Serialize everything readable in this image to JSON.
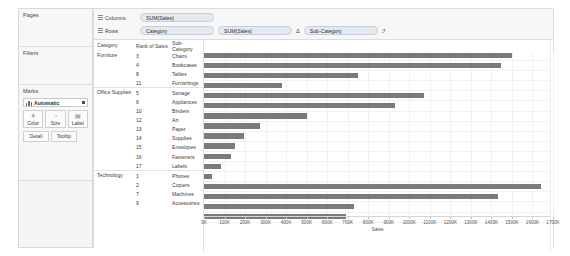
{
  "sidebar": {
    "pages": {
      "title": "Pages"
    },
    "filters": {
      "title": "Filters"
    },
    "marks": {
      "title": "Marks",
      "mark_type": "Automatic",
      "mark_type_icon": "bar-chart-icon",
      "buttons": [
        {
          "label": "Color",
          "icon": "color-palette-icon",
          "glyph": "⚘"
        },
        {
          "label": "Size",
          "icon": "size-icon",
          "glyph": "◔"
        },
        {
          "label": "Label",
          "icon": "label-icon",
          "glyph": "▤"
        }
      ],
      "buttons_small": [
        {
          "label": "Detail",
          "icon": "detail-icon"
        },
        {
          "label": "Tooltip",
          "icon": "tooltip-icon"
        }
      ]
    }
  },
  "shelves": {
    "columns": {
      "label": "Columns",
      "icon": "columns-grid-icon",
      "pills": [
        {
          "text": "SUM(Sales)"
        }
      ]
    },
    "rows": {
      "label": "Rows",
      "icon": "rows-grid-icon",
      "pills": [
        {
          "text": "Category"
        },
        {
          "text": "SUM(Sales)"
        },
        {
          "text": "Sub-Category"
        }
      ],
      "sort_icon": "sort-delta-icon",
      "sort_glyph": "Δ",
      "filter_icon": "filter-funnel-icon",
      "filter_glyph": "ℱ"
    }
  },
  "table": {
    "headers": {
      "category": "Category",
      "rank": "Rank of Sales",
      "subcategory": "Sub-Category"
    },
    "categories": [
      {
        "name": "Furniture",
        "rows": [
          {
            "rank": "3",
            "subcategory": "Chairs",
            "sales": 1501
          },
          {
            "rank": "4",
            "subcategory": "Bookcases",
            "sales": 1445
          },
          {
            "rank": "8",
            "subcategory": "Tables",
            "sales": 750
          },
          {
            "rank": "11",
            "subcategory": "Furnishings",
            "sales": 382
          }
        ]
      },
      {
        "name": "Office Supplies",
        "rows": [
          {
            "rank": "5",
            "subcategory": "Storage",
            "sales": 1073
          },
          {
            "rank": "6",
            "subcategory": "Appliances",
            "sales": 930
          },
          {
            "rank": "10",
            "subcategory": "Binders",
            "sales": 500
          },
          {
            "rank": "12",
            "subcategory": "Art",
            "sales": 275
          },
          {
            "rank": "13",
            "subcategory": "Paper",
            "sales": 196
          },
          {
            "rank": "14",
            "subcategory": "Supplies",
            "sales": 150
          },
          {
            "rank": "15",
            "subcategory": "Envelopes",
            "sales": 133
          },
          {
            "rank": "16",
            "subcategory": "Fasteners",
            "sales": 82
          },
          {
            "rank": "17",
            "subcategory": "Labels",
            "sales": 40
          }
        ]
      },
      {
        "name": "Technology",
        "rows": [
          {
            "rank": "1",
            "subcategory": "Phones",
            "sales": 1640
          },
          {
            "rank": "2",
            "subcategory": "Copiers",
            "sales": 1430
          },
          {
            "rank": "7",
            "subcategory": "Machines",
            "sales": 733
          },
          {
            "rank": "9",
            "subcategory": "Accessories",
            "sales": 690
          }
        ]
      }
    ]
  },
  "chart_data": {
    "type": "bar",
    "title": "",
    "xlabel": "Sales",
    "ylabel": "",
    "orientation": "horizontal",
    "grid": true,
    "legend": "none",
    "bar_color": "#7a7a7a",
    "xlim": [
      0,
      1700
    ],
    "xtick_labels": [
      "0K",
      "100K",
      "200K",
      "300K",
      "400K",
      "500K",
      "600K",
      "700K",
      "800K",
      "900K",
      "1000K",
      "1100K",
      "1200K",
      "1300K",
      "1400K",
      "1500K",
      "1600K",
      "1700K"
    ],
    "xtick_values": [
      0,
      100,
      200,
      300,
      400,
      500,
      600,
      700,
      800,
      900,
      1000,
      1100,
      1200,
      1300,
      1400,
      1500,
      1600,
      1700
    ],
    "unit": "thousands",
    "categories": [
      "Chairs",
      "Bookcases",
      "Tables",
      "Furnishings",
      "Storage",
      "Appliances",
      "Binders",
      "Art",
      "Paper",
      "Supplies",
      "Envelopes",
      "Fasteners",
      "Labels",
      "Phones",
      "Copiers",
      "Machines",
      "Accessories"
    ],
    "values": [
      1501,
      1445,
      750,
      382,
      1073,
      930,
      500,
      275,
      196,
      150,
      133,
      82,
      40,
      1640,
      1430,
      733,
      690
    ],
    "groups": [
      "Furniture",
      "Furniture",
      "Furniture",
      "Furniture",
      "Office Supplies",
      "Office Supplies",
      "Office Supplies",
      "Office Supplies",
      "Office Supplies",
      "Office Supplies",
      "Office Supplies",
      "Office Supplies",
      "Office Supplies",
      "Technology",
      "Technology",
      "Technology",
      "Technology"
    ],
    "ranks": [
      3,
      4,
      8,
      11,
      5,
      6,
      10,
      12,
      13,
      14,
      15,
      16,
      17,
      1,
      2,
      7,
      9
    ]
  }
}
